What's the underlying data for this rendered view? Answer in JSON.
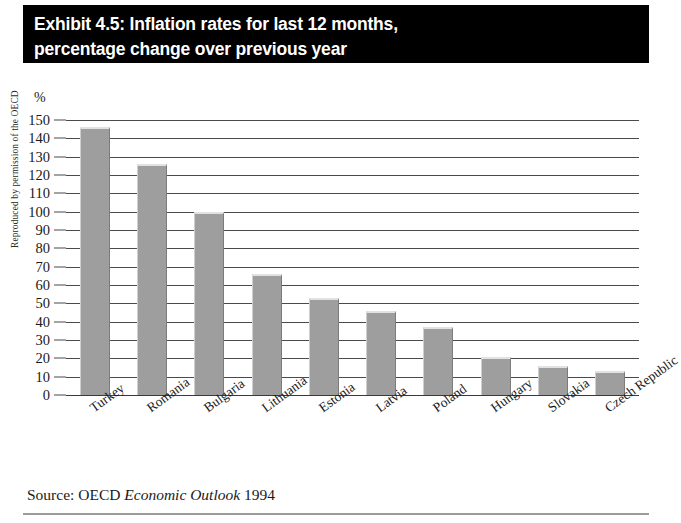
{
  "title": {
    "line1": "Exhibit 4.5: Inflation rates for last 12 months,",
    "line2": "percentage change over previous year"
  },
  "credit": "Reproduced by permission of the OECD",
  "source": {
    "prefix": "Source: OECD",
    "italic": "Economic Outlook",
    "suffix": "1994"
  },
  "axis": {
    "unit": "%"
  },
  "colors": {
    "banner_background": "#000000",
    "banner_text": "#ffffff",
    "bar_fill": "#9e9e9e",
    "bar_highlight": "#e2e2e2",
    "gridline": "#4a4a4a",
    "page_background": "#ffffff",
    "rule": "#9b9b9b"
  },
  "chart_data": {
    "type": "bar",
    "title": "Exhibit 4.5: Inflation rates for last 12 months, percentage change over previous year",
    "subtitle": "",
    "xlabel": "",
    "ylabel": "%",
    "ylim": [
      0,
      150
    ],
    "ytick_step": 10,
    "yticks": [
      0,
      10,
      20,
      30,
      40,
      50,
      60,
      70,
      80,
      90,
      100,
      110,
      120,
      130,
      140,
      150
    ],
    "ytick_labels": [
      "0",
      "10",
      "20",
      "30",
      "40",
      "50",
      "60",
      "70",
      "80",
      "90",
      "100",
      "110",
      "120",
      "130",
      "140",
      "150"
    ],
    "grid": true,
    "grid_axis": "y",
    "legend": false,
    "legend_position": "none",
    "orientation": "vertical",
    "categories": [
      "Turkey",
      "Romania",
      "Bulgaria",
      "Lithuania",
      "Estonia",
      "Latvia",
      "Poland",
      "Hungary",
      "Slovakia",
      "Czech Republic"
    ],
    "values": [
      146,
      126,
      100,
      66,
      53,
      46,
      37,
      21,
      16,
      13
    ],
    "annotations": [
      "Reproduced by permission of the OECD",
      "Source: OECD Economic Outlook 1994"
    ]
  }
}
